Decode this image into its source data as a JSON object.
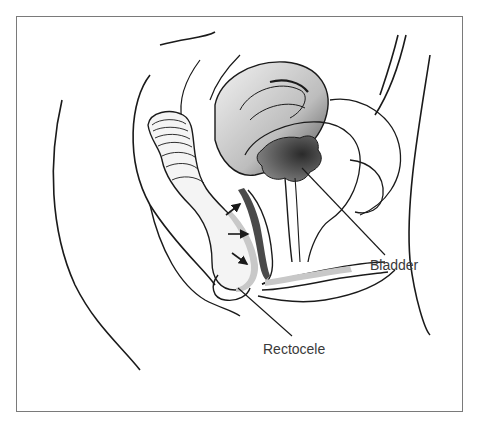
{
  "figure": {
    "labels": {
      "bladder": "Bladder",
      "rectocele": "Rectocele"
    },
    "arrows_count": 3,
    "colors": {
      "outline": "#1a1a1a",
      "frame": "#7a7a7a",
      "shading_light": "#c8c8c8",
      "shading_dark": "#4a4a4a",
      "label_text": "#3a3a3a"
    }
  }
}
